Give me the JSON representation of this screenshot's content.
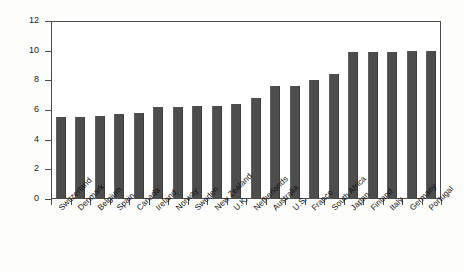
{
  "chart_data": {
    "type": "bar",
    "title": "",
    "xlabel": "",
    "ylabel": "Risk premium, %",
    "ylim": [
      0,
      12
    ],
    "yticks": [
      0,
      2,
      4,
      6,
      8,
      10,
      12
    ],
    "grid": false,
    "legend": null,
    "bar_color": "#4d4d4d",
    "axis_color": "#4a4a4a",
    "background_color": "#fdfdfb",
    "categories": [
      "Switzerland",
      "Denmark",
      "Belgium",
      "Spain",
      "Canada",
      "Ireland",
      "Norway",
      "Sweden",
      "New Zealand",
      "U.K.",
      "Netherlands",
      "Australia",
      "U.S.",
      "France",
      "South Africa",
      "Japan",
      "Finland",
      "Italy",
      "Germany",
      "Portugal"
    ],
    "values": [
      5.5,
      5.5,
      5.6,
      5.7,
      5.8,
      6.2,
      6.2,
      6.3,
      6.3,
      6.4,
      6.8,
      7.6,
      7.6,
      8.0,
      8.4,
      9.9,
      9.9,
      9.9,
      10.0,
      10.0
    ]
  }
}
